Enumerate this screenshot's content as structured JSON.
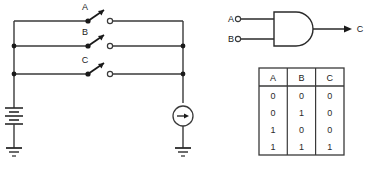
{
  "figure": {
    "colors": {
      "wire": "#3a3a3a",
      "wire_dark": "#1a1a1a",
      "text": "#1a1a1a",
      "table_border": "#3a3a3a",
      "background": "#ffffff"
    }
  },
  "circuit": {
    "name": "switch-circuit",
    "switches": [
      {
        "label": "A",
        "state": "open"
      },
      {
        "label": "B",
        "state": "open"
      },
      {
        "label": "C",
        "state": "open"
      }
    ],
    "battery": {
      "name": "battery",
      "label": ""
    },
    "source": {
      "name": "current-source",
      "label": ""
    },
    "grounds": [
      {
        "name": "ground-left"
      },
      {
        "name": "ground-right"
      }
    ]
  },
  "gate": {
    "name": "and-gate",
    "type": "AND",
    "inputs": [
      {
        "label": "A"
      },
      {
        "label": "B"
      }
    ],
    "output": {
      "label": "C"
    }
  },
  "truth_table": {
    "name": "truth-table",
    "headers": [
      "A",
      "B",
      "C"
    ],
    "rows": [
      [
        "0",
        "0",
        "0"
      ],
      [
        "0",
        "1",
        "0"
      ],
      [
        "1",
        "0",
        "0"
      ],
      [
        "1",
        "1",
        "1"
      ]
    ]
  }
}
